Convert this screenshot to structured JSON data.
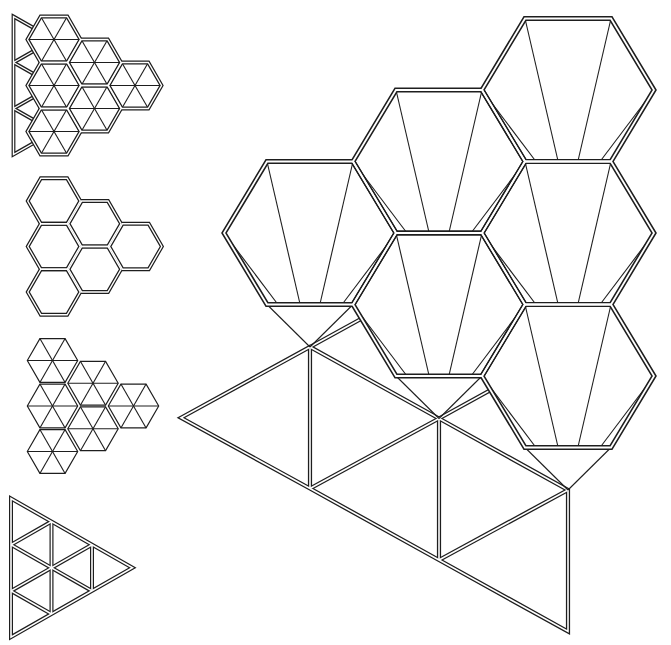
{
  "colors": {
    "line": "#1e1e1e",
    "background": "#ffffff"
  },
  "figures": {
    "overlay": {
      "description": "hexagons over triangle grid",
      "hex_columns": 3,
      "hex_count": 6,
      "hex_outline": "double",
      "hex_interior": "six-triangles",
      "underlay": "triangle-grid",
      "grid_divisions": 3,
      "orientation": "pointing-right"
    },
    "honeycomb": {
      "description": "double-line honeycomb",
      "hex_columns": 3,
      "hex_count": 6,
      "hex_outline": "double",
      "hex_interior": "empty",
      "orientation": "pointing-right"
    },
    "triangulated": {
      "description": "hexagons split into triangles",
      "hex_columns": 3,
      "hex_count": 6,
      "hex_outline": "single",
      "hex_interior": "six-triangles",
      "orientation": "pointing-right"
    },
    "triangle_grid": {
      "description": "triangle subdivided into nine triangles",
      "grid_divisions": 3,
      "triangle_count": 9,
      "outline": "double",
      "orientation": "pointing-right"
    },
    "assembly": {
      "description": "hexagonal caps with converging creases over triangle strip",
      "hex_columns": 3,
      "hex_count": 6,
      "hex_outline": "double",
      "hex_interior": "converging-creases",
      "triangle_strip_count": 5,
      "orientation": "pointing-left"
    }
  }
}
